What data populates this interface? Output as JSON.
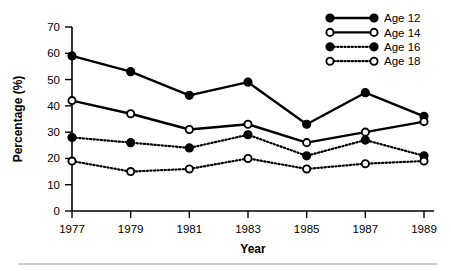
{
  "chart_data": {
    "type": "line",
    "title": "",
    "xlabel": "Year",
    "ylabel": "Percentage (%)",
    "categories": [
      "1977",
      "1979",
      "1981",
      "1983",
      "1985",
      "1987",
      "1989"
    ],
    "x": [
      1977,
      1979,
      1981,
      1983,
      1985,
      1987,
      1989
    ],
    "xlim": [
      1977,
      1989
    ],
    "ylim": [
      0,
      70
    ],
    "yticks": [
      0,
      10,
      20,
      30,
      40,
      50,
      60,
      70
    ],
    "ytick_labels": [
      "0",
      "10",
      "20",
      "30",
      "40",
      "50",
      "60",
      "70"
    ],
    "grid": false,
    "legend_position": "top-right",
    "series": [
      {
        "name": "Age 12",
        "marker": "filled-circle",
        "line_style": "solid",
        "color": "#000000",
        "values": [
          59,
          53,
          44,
          49,
          33,
          45,
          36
        ]
      },
      {
        "name": "Age 14",
        "marker": "open-circle",
        "line_style": "solid",
        "color": "#000000",
        "values": [
          42,
          37,
          31,
          33,
          26,
          30,
          34
        ]
      },
      {
        "name": "Age 16",
        "marker": "filled-circle",
        "line_style": "dotted",
        "color": "#000000",
        "values": [
          28,
          26,
          24,
          29,
          21,
          27,
          21
        ]
      },
      {
        "name": "Age 18",
        "marker": "open-circle",
        "line_style": "dotted",
        "color": "#000000",
        "values": [
          19,
          15,
          16,
          20,
          16,
          18,
          19
        ]
      }
    ]
  },
  "legend": {
    "items": [
      {
        "label": "Age 12"
      },
      {
        "label": "Age 14"
      },
      {
        "label": "Age 16"
      },
      {
        "label": "Age 18"
      }
    ]
  },
  "axes": {
    "x_title": "Year",
    "y_title": "Percentage (%)"
  }
}
